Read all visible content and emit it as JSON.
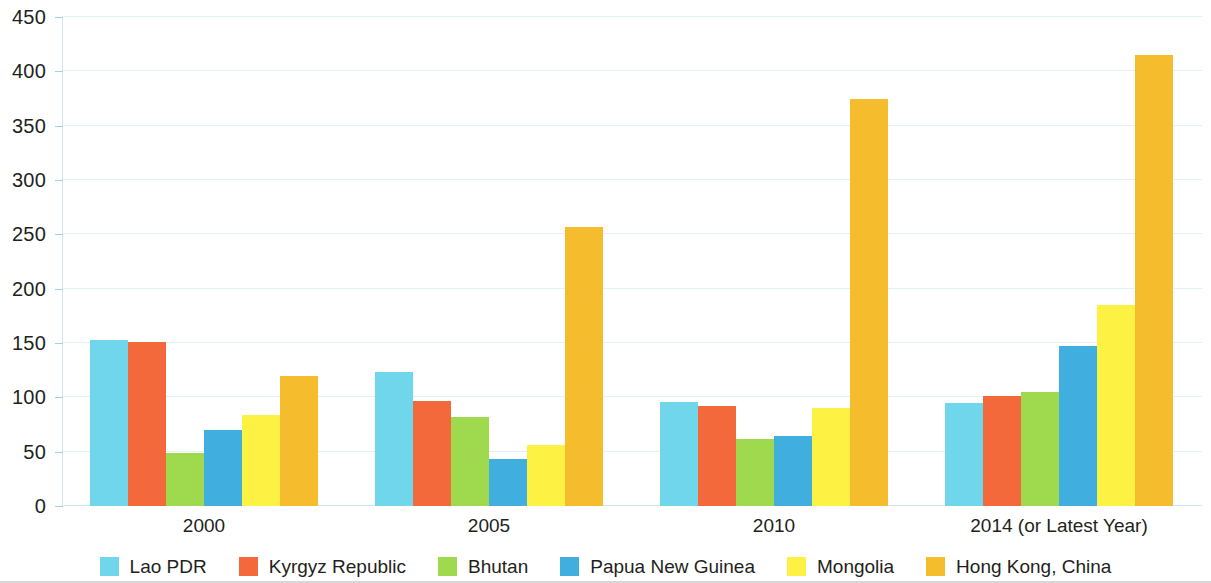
{
  "chart_data": {
    "type": "bar",
    "title": "",
    "subtitle": "",
    "xlabel": "",
    "ylabel": "",
    "categories": [
      "2000",
      "2005",
      "2010",
      "2014 (or Latest Year)"
    ],
    "ylim": [
      0,
      450
    ],
    "yticks": [
      0,
      50,
      100,
      150,
      200,
      250,
      300,
      350,
      400,
      450
    ],
    "ytick_labels": [
      "0",
      "50",
      "100",
      "150",
      "200",
      "250",
      "300",
      "350",
      "400",
      "450"
    ],
    "grid": true,
    "legend_position": "bottom",
    "series": [
      {
        "name": "Lao PDR",
        "color": "#6FD6EC",
        "values": [
          153,
          123,
          96,
          95
        ]
      },
      {
        "name": "Kyrgyz Republic",
        "color": "#F4693C",
        "values": [
          151,
          97,
          92,
          101
        ]
      },
      {
        "name": "Bhutan",
        "color": "#9ED94E",
        "values": [
          49,
          82,
          62,
          105
        ]
      },
      {
        "name": "Papua New Guinea",
        "color": "#41AEE0",
        "values": [
          70,
          43,
          64,
          147
        ]
      },
      {
        "name": "Mongolia",
        "color": "#FDF243",
        "values": [
          84,
          56,
          90,
          185
        ]
      },
      {
        "name": "Hong Kong, China",
        "color": "#F5BC2E",
        "values": [
          120,
          257,
          375,
          415
        ]
      }
    ]
  },
  "axis": {
    "gridline_color": "#dff2f7",
    "axis_color": "#cfe9f0",
    "tick_color": "#9fd6e4",
    "text_color": "#231f20"
  }
}
